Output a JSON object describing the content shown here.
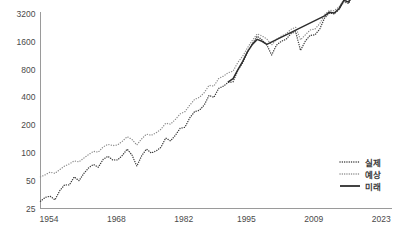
{
  "chart_data": {
    "type": "line",
    "title": "",
    "subtitle": "",
    "xlabel": "",
    "ylabel": "",
    "yscale": "log",
    "ylim": [
      25,
      3200
    ],
    "xlim": [
      1954,
      2027
    ],
    "grid": false,
    "legend_position": "bottom-right",
    "y_ticks": [
      {
        "value": 3200,
        "label": "3200"
      },
      {
        "value": 1600,
        "label": "1600"
      },
      {
        "value": 800,
        "label": "800"
      },
      {
        "value": 400,
        "label": "400"
      },
      {
        "value": 200,
        "label": "200"
      },
      {
        "value": 100,
        "label": "100"
      },
      {
        "value": 50,
        "label": "50"
      },
      {
        "value": 25,
        "label": "25"
      }
    ],
    "x_ticks": [
      {
        "value": 1954,
        "label": "1954"
      },
      {
        "value": 1968,
        "label": "1968"
      },
      {
        "value": 1982,
        "label": "1982"
      },
      {
        "value": 1995,
        "label": "1995"
      },
      {
        "value": 2009,
        "label": "2009"
      },
      {
        "value": 2023,
        "label": "2023"
      }
    ],
    "legend": [
      {
        "name": "실제",
        "style": "dotted",
        "color": "#3c3c3c"
      },
      {
        "name": "예상",
        "style": "dotted",
        "color": "#8c8c8c"
      },
      {
        "name": "미래",
        "style": "solid",
        "color": "#2e2e2e"
      }
    ],
    "series": [
      {
        "name": "실제",
        "style": "dotted",
        "color": "#3c3c3c",
        "x": [
          1954,
          1955,
          1956,
          1957,
          1958,
          1959,
          1960,
          1961,
          1962,
          1963,
          1964,
          1965,
          1966,
          1967,
          1968,
          1969,
          1970,
          1971,
          1972,
          1973,
          1974,
          1975,
          1976,
          1977,
          1978,
          1979,
          1980,
          1981,
          1982,
          1983,
          1984,
          1985,
          1986,
          1987,
          1988,
          1989,
          1990,
          1991,
          1992,
          1993,
          1994,
          1995,
          1996,
          1997,
          1998,
          1999,
          2000,
          2001,
          2002,
          2003,
          2004,
          2005,
          2006,
          2007,
          2008,
          2009,
          2010,
          2011,
          2012,
          2013,
          2014,
          2015,
          2016,
          2017,
          2018,
          2019,
          2020,
          2021,
          2022,
          2023
        ],
        "y": [
          30,
          33,
          34,
          31,
          39,
          45,
          45,
          55,
          50,
          60,
          69,
          75,
          70,
          85,
          92,
          84,
          84,
          94,
          110,
          95,
          72,
          93,
          110,
          100,
          105,
          115,
          145,
          135,
          155,
          185,
          190,
          240,
          280,
          290,
          330,
          420,
          400,
          500,
          530,
          580,
          590,
          790,
          950,
          1230,
          1520,
          1840,
          1680,
          1480,
          1150,
          1470,
          1620,
          1700,
          1960,
          2060,
          1290,
          1630,
          1880,
          1900,
          2200,
          2900,
          3280,
          3210,
          3580,
          4350,
          4150,
          5440,
          6450,
          8300,
          5650,
          7180
        ]
      },
      {
        "name": "예상",
        "style": "dotted",
        "color": "#8c8c8c",
        "x": [
          1954,
          1955,
          1956,
          1957,
          1958,
          1959,
          1960,
          1961,
          1962,
          1963,
          1964,
          1965,
          1966,
          1967,
          1968,
          1969,
          1970,
          1971,
          1972,
          1973,
          1974,
          1975,
          1976,
          1977,
          1978,
          1979,
          1980,
          1981,
          1982,
          1983,
          1984,
          1985,
          1986,
          1987,
          1988,
          1989,
          1990,
          1991,
          1992,
          1993,
          1994,
          1995,
          1996,
          1997,
          1998,
          1999,
          2000,
          2001,
          2002,
          2003,
          2004,
          2005,
          2006,
          2007,
          2008,
          2009,
          2010,
          2011,
          2012,
          2013,
          2014,
          2015,
          2016,
          2017,
          2018,
          2019,
          2020,
          2021,
          2022,
          2023
        ],
        "y": [
          55,
          58,
          62,
          60,
          66,
          72,
          76,
          82,
          80,
          88,
          96,
          104,
          102,
          116,
          124,
          120,
          122,
          134,
          150,
          140,
          122,
          142,
          160,
          155,
          165,
          180,
          210,
          205,
          230,
          265,
          280,
          330,
          380,
          400,
          450,
          540,
          530,
          640,
          680,
          740,
          770,
          960,
          1120,
          1380,
          1660,
          1950,
          1850,
          1720,
          1480,
          1700,
          1840,
          1950,
          2180,
          2300,
          1680,
          1900,
          2150,
          2200,
          2520,
          3150,
          3500,
          3480,
          3820,
          4550,
          4400,
          5600,
          6600,
          8400,
          6000,
          7400
        ]
      },
      {
        "name": "미래",
        "style": "solid",
        "color": "#2e2e2e",
        "x": [
          1993,
          1994,
          1995,
          1996,
          1997,
          1998,
          1999,
          2000,
          2001,
          2013,
          2014,
          2015,
          2016,
          2017,
          2018,
          2019,
          2020,
          2021,
          2022,
          2023,
          2024,
          2025,
          2026
        ],
        "y": [
          590,
          640,
          800,
          980,
          1250,
          1500,
          1700,
          1620,
          1500,
          3050,
          3350,
          3280,
          3650,
          4500,
          4300,
          5500,
          7400,
          9600,
          8200,
          9300,
          8800,
          9100,
          9400
        ]
      }
    ]
  }
}
